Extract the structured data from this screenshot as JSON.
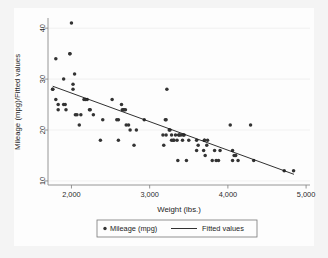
{
  "chart_data": {
    "type": "scatter",
    "title": "",
    "xlabel": "Weight (lbs.)",
    "ylabel": "Mileage (mpg)/Fitted values",
    "xlim": [
      1700,
      5050
    ],
    "ylim": [
      9.2,
      42
    ],
    "xticks": [
      2000,
      3000,
      4000,
      5000
    ],
    "xtick_labels": [
      "2,000",
      "3,000",
      "4,000",
      "5,000"
    ],
    "yticks": [
      10,
      20,
      30,
      40
    ],
    "ytick_labels": [
      "10",
      "20",
      "30",
      "40"
    ],
    "grid": "horizontal-faint",
    "legend_position": "bottom-outside",
    "marker_color": "#333333",
    "line_color": "#1a1a1a",
    "background_color": "#f4f4f4",
    "plot_background_color": "#fdfdfd",
    "series": [
      {
        "name": "Mileage (mpg)",
        "type": "scatter",
        "marker": "circle",
        "points": [
          [
            1760,
            28
          ],
          [
            1760,
            28
          ],
          [
            1800,
            34
          ],
          [
            1800,
            26
          ],
          [
            1830,
            25
          ],
          [
            1830,
            24
          ],
          [
            1900,
            25
          ],
          [
            1900,
            30
          ],
          [
            1920,
            25
          ],
          [
            1930,
            24
          ],
          [
            1980,
            35
          ],
          [
            1980,
            35
          ],
          [
            2000,
            41
          ],
          [
            2020,
            28
          ],
          [
            2020,
            29
          ],
          [
            2040,
            31
          ],
          [
            2050,
            23
          ],
          [
            2070,
            23
          ],
          [
            2100,
            21
          ],
          [
            2120,
            23
          ],
          [
            2160,
            26
          ],
          [
            2180,
            26
          ],
          [
            2200,
            26
          ],
          [
            2230,
            24
          ],
          [
            2240,
            24
          ],
          [
            2280,
            23
          ],
          [
            2370,
            18
          ],
          [
            2400,
            22
          ],
          [
            2520,
            26
          ],
          [
            2580,
            22
          ],
          [
            2600,
            22
          ],
          [
            2600,
            18
          ],
          [
            2640,
            25
          ],
          [
            2650,
            24
          ],
          [
            2670,
            24
          ],
          [
            2670,
            24
          ],
          [
            2690,
            24
          ],
          [
            2700,
            21
          ],
          [
            2730,
            21
          ],
          [
            2750,
            20
          ],
          [
            2800,
            17
          ],
          [
            2830,
            20
          ],
          [
            2930,
            22
          ],
          [
            3170,
            19
          ],
          [
            3180,
            17
          ],
          [
            3200,
            22
          ],
          [
            3210,
            22
          ],
          [
            3210,
            19
          ],
          [
            3220,
            28
          ],
          [
            3250,
            20
          ],
          [
            3260,
            20
          ],
          [
            3280,
            19
          ],
          [
            3280,
            18
          ],
          [
            3300,
            18
          ],
          [
            3310,
            18
          ],
          [
            3330,
            19
          ],
          [
            3350,
            18
          ],
          [
            3360,
            14
          ],
          [
            3370,
            19
          ],
          [
            3380,
            19
          ],
          [
            3400,
            19
          ],
          [
            3420,
            18
          ],
          [
            3430,
            19
          ],
          [
            3440,
            19
          ],
          [
            3470,
            14
          ],
          [
            3500,
            18
          ],
          [
            3600,
            16
          ],
          [
            3600,
            18
          ],
          [
            3620,
            17
          ],
          [
            3690,
            16
          ],
          [
            3700,
            18
          ],
          [
            3700,
            18
          ],
          [
            3710,
            15
          ],
          [
            3730,
            17
          ],
          [
            3740,
            18
          ],
          [
            3800,
            14
          ],
          [
            3830,
            16
          ],
          [
            3850,
            14
          ],
          [
            3880,
            14
          ],
          [
            3900,
            16
          ],
          [
            4030,
            21
          ],
          [
            4060,
            14
          ],
          [
            4060,
            16
          ],
          [
            4080,
            15
          ],
          [
            4100,
            15
          ],
          [
            4130,
            14
          ],
          [
            4290,
            21
          ],
          [
            4330,
            14
          ],
          [
            4720,
            12
          ],
          [
            4840,
            12
          ]
        ]
      },
      {
        "name": "Fitted values",
        "type": "line",
        "endpoints": [
          [
            1760,
            28.6
          ],
          [
            4845,
            11.3
          ]
        ],
        "slope_per_1000lbs": -5.61
      }
    ]
  },
  "legend": {
    "items": [
      {
        "label": "Mileage (mpg)",
        "marker": "circle"
      },
      {
        "label": "Fitted values",
        "marker": "line"
      }
    ]
  },
  "axes": {
    "x_title": "Weight (lbs.)",
    "y_title": "Mileage (mpg)/Fitted values"
  }
}
